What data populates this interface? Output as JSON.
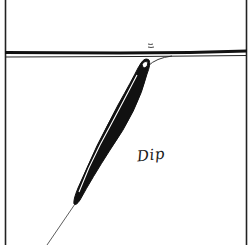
{
  "diagram": {
    "label": "Dip",
    "colors": {
      "ink": "#111111",
      "background": "#ffffff",
      "float_highlight": "#ffffff"
    },
    "elements": {
      "frame": "panel-border-left-right",
      "water_surface": "double-line-surface",
      "float": "tilted-black-float",
      "line_below": "fishing-line-to-bottom-left",
      "line_above": "fishing-line-curving-right",
      "ripples": "ripple-marks-above-tip"
    }
  }
}
